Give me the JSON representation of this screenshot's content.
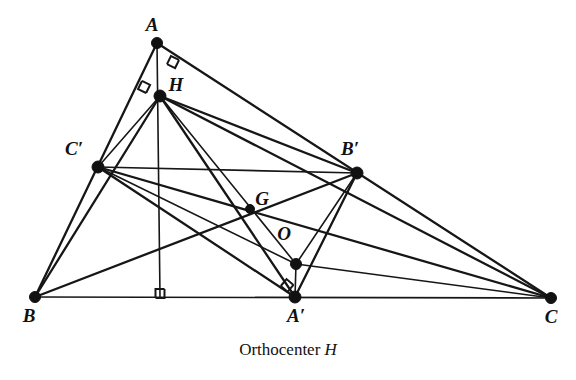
{
  "figure": {
    "title_caption": "Orthocenter",
    "caption_point": "H",
    "background_color": "#ffffff",
    "ink_color": "#161616",
    "labels": {
      "A": "A",
      "B": "B",
      "C": "C",
      "H": "H",
      "G": "G",
      "O": "O",
      "A_prime": "A′",
      "B_prime": "B′",
      "C_prime": "C′"
    },
    "points": {
      "A": {
        "x": 157,
        "y": 43,
        "label": "A",
        "label_x": 152,
        "label_y": 31
      },
      "B": {
        "x": 35,
        "y": 297,
        "label": "B",
        "label_x": 29,
        "label_y": 322
      },
      "C": {
        "x": 551,
        "y": 298,
        "label": "C",
        "label_x": 551,
        "label_y": 323
      },
      "H": {
        "x": 160,
        "y": 96,
        "label": "H",
        "label_x": 176,
        "label_y": 91
      },
      "G": {
        "x": 250,
        "y": 209,
        "label": "G",
        "label_x": 262,
        "label_y": 205
      },
      "O": {
        "x": 296,
        "y": 264,
        "label": "O",
        "label_x": 284,
        "label_y": 240
      },
      "Ap": {
        "x": 295,
        "y": 297,
        "label": "A′",
        "label_x": 296,
        "label_y": 322
      },
      "Bp": {
        "x": 357,
        "y": 173,
        "label": "B′",
        "label_x": 350,
        "label_y": 155
      },
      "Cp": {
        "x": 98,
        "y": 167,
        "label": "C′",
        "label_x": 74,
        "label_y": 155
      },
      "F": {
        "x": 160,
        "y": 297,
        "label": "",
        "label_x": 0,
        "label_y": 0
      }
    },
    "segments": [
      {
        "name": "side-BC",
        "from": "B",
        "to": "C",
        "weight": "thin"
      },
      {
        "name": "side-AB",
        "from": "A",
        "to": "B",
        "weight": "med"
      },
      {
        "name": "side-AC",
        "from": "A",
        "to": "C",
        "weight": "med"
      },
      {
        "name": "altitude-A-foot",
        "from": "A",
        "to": "F",
        "weight": "thin"
      },
      {
        "name": "altitude-B-Bp",
        "from": "B",
        "to": "Bp",
        "weight": "med"
      },
      {
        "name": "altitude-C-Cp",
        "from": "C",
        "to": "Cp",
        "weight": "med"
      },
      {
        "name": "midline-Cp-Bp",
        "from": "Cp",
        "to": "Bp",
        "weight": "thin"
      },
      {
        "name": "median-Cp-Ap",
        "from": "Cp",
        "to": "Ap",
        "weight": "med"
      },
      {
        "name": "median-Bp-Ap",
        "from": "Bp",
        "to": "Ap",
        "weight": "med"
      },
      {
        "name": "perp-bisector-Bp-O",
        "from": "Bp",
        "to": "O",
        "weight": "thin"
      },
      {
        "name": "perp-bisector-Cp-O",
        "from": "Cp",
        "to": "O",
        "weight": "thin"
      },
      {
        "name": "perp-bisector-Ap-O",
        "from": "Ap",
        "to": "O",
        "weight": "thin"
      },
      {
        "name": "euler-line-H-O",
        "from": "H",
        "to": "O",
        "weight": "thin"
      },
      {
        "name": "cevian-H-Ap",
        "from": "H",
        "to": "Ap",
        "weight": "med"
      },
      {
        "name": "cevian-H-Bp",
        "from": "H",
        "to": "Bp",
        "weight": "med"
      },
      {
        "name": "cevian-H-Cp",
        "from": "H",
        "to": "Cp",
        "weight": "thin"
      },
      {
        "name": "cevian-H-C",
        "from": "H",
        "to": "C",
        "weight": "med"
      },
      {
        "name": "cevian-H-B",
        "from": "H",
        "to": "B",
        "weight": "med"
      },
      {
        "name": "segment-O-C",
        "from": "O",
        "to": "C",
        "weight": "thin"
      }
    ],
    "right_angle_marks": [
      {
        "name": "right-angle-at-Bp",
        "x": 175,
        "y": 58,
        "rotation": 26
      },
      {
        "name": "right-angle-at-Cp",
        "x": 140,
        "y": 85,
        "rotation": -64
      },
      {
        "name": "right-angle-at-foot",
        "x": 160,
        "y": 289,
        "rotation": 0
      },
      {
        "name": "right-angle-at-O",
        "x": 290,
        "y": 282,
        "rotation": 40
      }
    ]
  }
}
